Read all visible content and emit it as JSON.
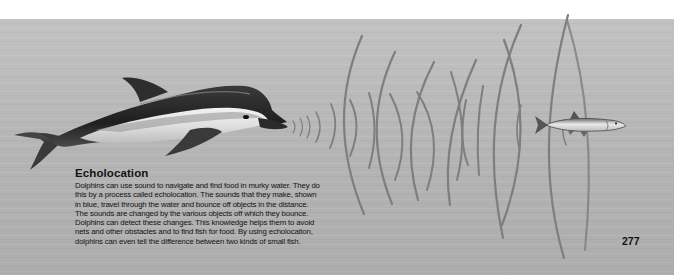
{
  "illustration": {
    "subjects": [
      "dolphin",
      "sound-waves",
      "fish"
    ],
    "wave_color": "#7a7a7a",
    "background_color": "#b8b8b8"
  },
  "caption": {
    "heading": "Echolocation",
    "body": "Dolphins can use sound to navigate and find food in murky water. They do\nthis by a process called echolocation. The sounds that they make, shown\nin blue, travel through the water and bounce off objects in the distance.\nThe sounds are changed by the various objects off which they bounce.\nDolphins can detect these changes. This knowledge helps them to avoid\nnets and other obstacles and to find fish for food. By using echolocation,\ndolphins can even tell the difference between two kinds of small fish."
  },
  "page": {
    "number": "277"
  }
}
